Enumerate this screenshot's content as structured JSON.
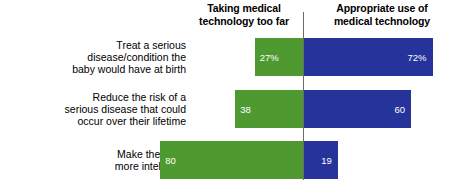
{
  "headers": {
    "left": "Taking medical\ntechnology too far",
    "right": "Appropriate use of\nmedical technology"
  },
  "colors": {
    "left_series": "#4e9a30",
    "right_series": "#26339b",
    "axis": "#6b6b6b",
    "value_text": "#ffffff",
    "background": "#ffffff"
  },
  "chart_data": {
    "type": "bar",
    "orientation": "horizontal",
    "layout": "diverging",
    "title": "",
    "subtitle": "",
    "xlabel": "",
    "ylabel": "",
    "grid": false,
    "legend_position": "top",
    "axis_center_value": 0,
    "units": "percent",
    "categories": [
      "Treat a serious disease/condition the baby would have at birth",
      "Reduce the risk of a serious disease that could occur over their lifetime",
      "Make the baby more intelligent"
    ],
    "category_lines": [
      [
        "Treat a serious",
        "disease/condition the",
        "baby would have at birth"
      ],
      [
        "Reduce the risk of a",
        "serious disease that could",
        "occur over their lifetime"
      ],
      [
        "Make the baby",
        "more intelligent"
      ]
    ],
    "series": [
      {
        "name": "Taking medical technology too far",
        "direction": "left",
        "color": "#4e9a30",
        "values": [
          27,
          38,
          80
        ],
        "labels": [
          "27%",
          "38",
          "80"
        ]
      },
      {
        "name": "Appropriate use of medical technology",
        "direction": "right",
        "color": "#26339b",
        "values": [
          72,
          60,
          19
        ],
        "labels": [
          "72%",
          "60",
          "19"
        ]
      }
    ]
  },
  "rows": [
    {
      "label_line1": "Treat a serious",
      "label_line2": "disease/condition the",
      "label_line3": "baby would have at birth",
      "left_label": "27%",
      "right_label": "72%"
    },
    {
      "label_line1": "Reduce the risk of a",
      "label_line2": "serious disease that could",
      "label_line3": "occur over their lifetime",
      "left_label": "38",
      "right_label": "60"
    },
    {
      "label_line1": "Make the baby",
      "label_line2": "more intelligent",
      "label_line3": "",
      "left_label": "80",
      "right_label": "19"
    }
  ]
}
